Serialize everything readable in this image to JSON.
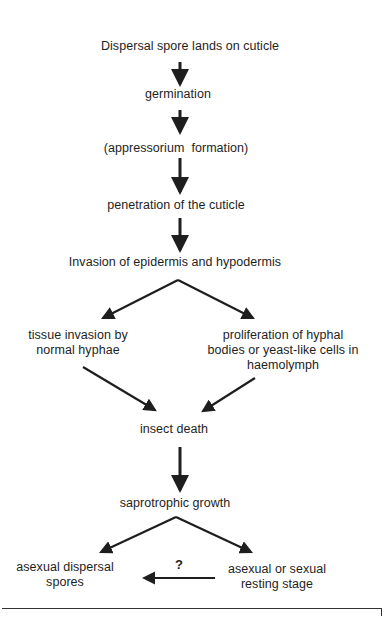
{
  "diagram": {
    "type": "flowchart",
    "nodes": [
      {
        "id": "n1",
        "label": "Dispersal spore lands on cuticle"
      },
      {
        "id": "n2",
        "label": "germination"
      },
      {
        "id": "n3",
        "label": "(appressorium  formation)"
      },
      {
        "id": "n4",
        "label": "penetration of the cuticle"
      },
      {
        "id": "n5",
        "label": "Invasion of epidermis and hypodermis"
      },
      {
        "id": "n6",
        "lines": [
          "tissue invasion by",
          "normal hyphae"
        ]
      },
      {
        "id": "n7",
        "lines": [
          "proliferation of hyphal",
          "bodies or yeast-like cells in",
          "haemolymph"
        ]
      },
      {
        "id": "n8",
        "label": "insect death"
      },
      {
        "id": "n9",
        "label": "saprotrophic growth"
      },
      {
        "id": "n10",
        "lines": [
          "asexual dispersal",
          "spores"
        ]
      },
      {
        "id": "n11",
        "lines": [
          "asexual or sexual",
          "resting stage"
        ]
      }
    ],
    "edges": [
      {
        "from": "n1",
        "to": "n2"
      },
      {
        "from": "n2",
        "to": "n3"
      },
      {
        "from": "n3",
        "to": "n4"
      },
      {
        "from": "n4",
        "to": "n5"
      },
      {
        "from": "n5",
        "to": "n6"
      },
      {
        "from": "n5",
        "to": "n7"
      },
      {
        "from": "n6",
        "to": "n8"
      },
      {
        "from": "n7",
        "to": "n8"
      },
      {
        "from": "n8",
        "to": "n9"
      },
      {
        "from": "n9",
        "to": "n10"
      },
      {
        "from": "n9",
        "to": "n11"
      },
      {
        "from": "n11",
        "to": "n10",
        "label": "?"
      }
    ],
    "question_mark": "?"
  }
}
